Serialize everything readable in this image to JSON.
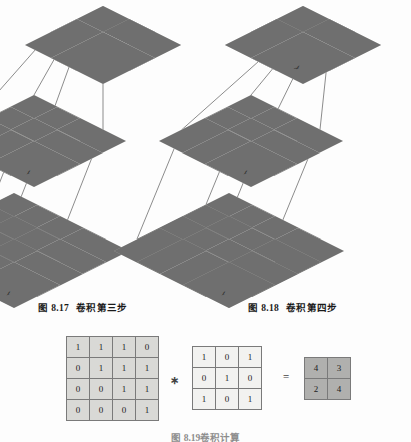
{
  "figure": {
    "title_left": "图 8.17　卷积第三步",
    "title_right": "图 8.18　卷积第四步",
    "caption_bottom": "图 8.19　卷积计算"
  },
  "captions": {
    "left": {
      "label": "图",
      "number": "8.17",
      "text": "卷积第三步"
    },
    "right": {
      "label": "图",
      "number": "8.18",
      "text": "卷积第四步"
    },
    "bottom": {
      "label": "图",
      "number": "8.19",
      "text": "卷积计算"
    }
  },
  "colors": {
    "cell_light": "#f2f2f0",
    "cell_mid": "#d9d9d6",
    "cell_dark": "#b0b0ae",
    "cell_darker": "#9a9a98",
    "border": "#6f6f6f",
    "wire": "#5a5a5a",
    "page_bg": "#fdfdfd"
  },
  "diagram_left": {
    "name": "convolution-step-3",
    "output": {
      "rows": 2,
      "cols": 2,
      "values": [
        [
          "4",
          "3"
        ],
        [
          "2",
          ""
        ]
      ],
      "highlight": [
        [
          false,
          false
        ],
        [
          true,
          false
        ]
      ]
    },
    "kernel": {
      "rows": 3,
      "cols": 3,
      "values": [
        [
          "1",
          "0",
          "1"
        ],
        [
          "0",
          "1",
          "0"
        ],
        [
          "1",
          "0",
          "1"
        ]
      ]
    },
    "input": {
      "rows": 4,
      "cols": 4,
      "values": [
        [
          "1",
          "1",
          "1",
          "0"
        ],
        [
          "0",
          "1",
          "1",
          "1"
        ],
        [
          "0",
          "0",
          "1",
          "1"
        ],
        [
          "0",
          "0",
          "0",
          "1"
        ]
      ],
      "highlight": [
        [
          false,
          false,
          false,
          false
        ],
        [
          true,
          true,
          true,
          false
        ],
        [
          true,
          true,
          true,
          false
        ],
        [
          true,
          true,
          true,
          false
        ]
      ]
    }
  },
  "diagram_right": {
    "name": "convolution-step-4",
    "output": {
      "rows": 2,
      "cols": 2,
      "values": [
        [
          "4",
          "3"
        ],
        [
          "2",
          "4"
        ]
      ],
      "highlight": [
        [
          false,
          false
        ],
        [
          false,
          true
        ]
      ]
    },
    "kernel": {
      "rows": 3,
      "cols": 3,
      "values": [
        [
          "1",
          "0",
          "1"
        ],
        [
          "0",
          "1",
          "0"
        ],
        [
          "1",
          "0",
          "1"
        ]
      ]
    },
    "input": {
      "rows": 4,
      "cols": 4,
      "values": [
        [
          "1",
          "1",
          "1",
          "0"
        ],
        [
          "0",
          "1",
          "1",
          "1"
        ],
        [
          "0",
          "0",
          "1",
          "1"
        ],
        [
          "0",
          "0",
          "0",
          "1"
        ]
      ],
      "highlight": [
        [
          false,
          false,
          false,
          false
        ],
        [
          true,
          true,
          false,
          true
        ],
        [
          true,
          true,
          false,
          true
        ],
        [
          true,
          true,
          false,
          true
        ]
      ]
    }
  },
  "equation": {
    "input_matrix": {
      "rows": 4,
      "cols": 4,
      "values": [
        [
          "1",
          "1",
          "1",
          "0"
        ],
        [
          "0",
          "1",
          "1",
          "1"
        ],
        [
          "0",
          "0",
          "1",
          "1"
        ],
        [
          "0",
          "0",
          "0",
          "1"
        ]
      ]
    },
    "operator_convolve": "∗",
    "kernel_matrix": {
      "rows": 3,
      "cols": 3,
      "values": [
        [
          "1",
          "0",
          "1"
        ],
        [
          "0",
          "1",
          "0"
        ],
        [
          "1",
          "0",
          "1"
        ]
      ]
    },
    "operator_equals": "=",
    "result_matrix": {
      "rows": 2,
      "cols": 2,
      "values": [
        [
          "4",
          "3"
        ],
        [
          "2",
          "4"
        ]
      ]
    }
  }
}
